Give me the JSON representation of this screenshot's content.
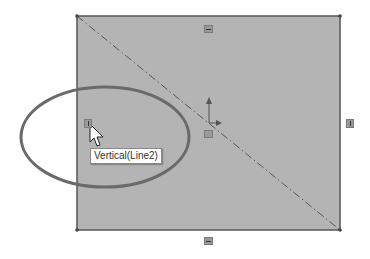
{
  "sketch": {
    "rectangle": {
      "fill": "#b4b4b4",
      "stroke": "#555555"
    },
    "centerline": {
      "style": "dash-dot",
      "color": "#555555"
    },
    "highlight_ellipse": {
      "color": "#6a6a6a"
    },
    "relations": [
      {
        "type": "horizontal",
        "position": "top"
      },
      {
        "type": "horizontal",
        "position": "bottom"
      },
      {
        "type": "vertical",
        "position": "left"
      },
      {
        "type": "vertical",
        "position": "right"
      },
      {
        "type": "midpoint",
        "position": "center"
      }
    ]
  },
  "tooltip": {
    "text": "Vertical(Line2)"
  }
}
